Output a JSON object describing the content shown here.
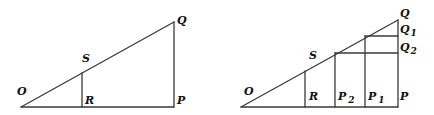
{
  "figures": [
    {
      "name": "figure-left",
      "points": {
        "O": {
          "x": 21,
          "y": 107
        },
        "R": {
          "x": 82,
          "y": 107
        },
        "S": {
          "x": 82,
          "y": 73
        },
        "P": {
          "x": 174,
          "y": 107
        },
        "Q": {
          "x": 174,
          "y": 22
        }
      },
      "labels": {
        "O": "O",
        "S": "S",
        "R": "R",
        "P": "P",
        "Q": "Q"
      }
    },
    {
      "name": "figure-right",
      "points": {
        "O": {
          "x": 241,
          "y": 107
        },
        "R": {
          "x": 305,
          "y": 107
        },
        "S": {
          "x": 305,
          "y": 69
        },
        "P2": {
          "x": 335,
          "y": 107
        },
        "P1": {
          "x": 365,
          "y": 107
        },
        "P": {
          "x": 398,
          "y": 107
        },
        "Q": {
          "x": 398,
          "y": 20
        },
        "Q1": {
          "x": 398,
          "y": 36
        },
        "Q2": {
          "x": 398,
          "y": 53
        }
      },
      "labels": {
        "O": "O",
        "S": "S",
        "R": "R",
        "P2_main": "P",
        "P2_sub": "2",
        "P1_main": "P",
        "P1_sub": "1",
        "P": "P",
        "Q": "Q",
        "Q1_main": "Q",
        "Q1_sub": "1",
        "Q2_main": "Q",
        "Q2_sub": "2"
      }
    }
  ],
  "colors": {
    "line": "#3a3a3a",
    "label": "#111111",
    "background": "#ffffff"
  }
}
